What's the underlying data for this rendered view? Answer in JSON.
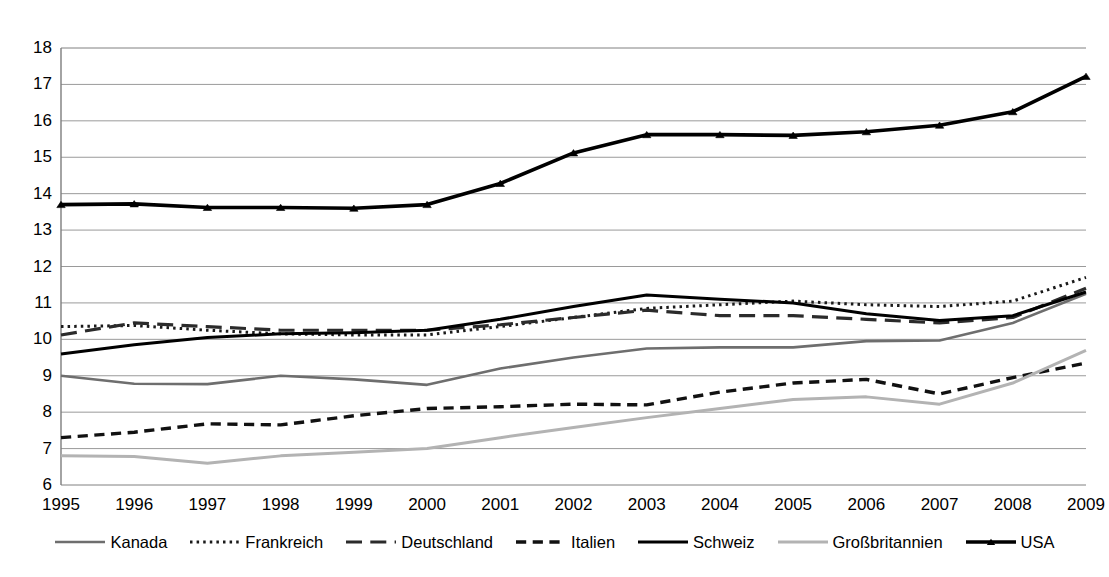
{
  "chart_data": {
    "type": "line",
    "title": "",
    "subtitle": "",
    "xlabel": "",
    "ylabel": "",
    "grid": true,
    "legend_position": "bottom",
    "xlim": [
      1995,
      2009
    ],
    "ylim": [
      6,
      18
    ],
    "ytick_step": 1,
    "categories": [
      1995,
      1996,
      1997,
      1998,
      1999,
      2000,
      2001,
      2002,
      2003,
      2004,
      2005,
      2006,
      2007,
      2008,
      2009
    ],
    "x_tick_labels": [
      "1995",
      "1996",
      "1997",
      "1998",
      "1999",
      "2000",
      "2001",
      "2002",
      "2003",
      "2004",
      "2005",
      "2006",
      "2007",
      "2008",
      "2009"
    ],
    "y_tick_labels": [
      "18",
      "17",
      "16",
      "15",
      "14",
      "13",
      "12",
      "11",
      "10",
      "9",
      "8",
      "7",
      "6"
    ],
    "series": [
      {
        "name": "Kanada",
        "color": "#6e6e6e",
        "style": "solid",
        "width": 2.6,
        "marker": "none",
        "values": [
          9.0,
          8.78,
          8.77,
          9.0,
          8.9,
          8.75,
          9.2,
          9.5,
          9.75,
          9.78,
          9.78,
          9.95,
          9.97,
          10.45,
          11.25
        ]
      },
      {
        "name": "Frankreich",
        "color": "#1a1a1a",
        "style": "dotted",
        "width": 3.0,
        "marker": "none",
        "values": [
          10.35,
          10.38,
          10.25,
          10.15,
          10.12,
          10.12,
          10.35,
          10.6,
          10.85,
          10.95,
          11.05,
          10.95,
          10.9,
          11.05,
          11.7
        ]
      },
      {
        "name": "Deutschland",
        "color": "#2b2b2b",
        "style": "longdash",
        "width": 3.2,
        "marker": "none",
        "values": [
          10.12,
          10.45,
          10.35,
          10.25,
          10.25,
          10.25,
          10.4,
          10.6,
          10.8,
          10.65,
          10.65,
          10.55,
          10.45,
          10.6,
          11.4
        ]
      },
      {
        "name": "Italien",
        "color": "#111111",
        "style": "dash",
        "width": 3.4,
        "marker": "none",
        "values": [
          7.3,
          7.45,
          7.68,
          7.65,
          7.9,
          8.1,
          8.15,
          8.22,
          8.2,
          8.55,
          8.8,
          8.9,
          8.5,
          8.95,
          9.35
        ]
      },
      {
        "name": "Schweiz",
        "color": "#000000",
        "style": "solid",
        "width": 3.0,
        "marker": "none",
        "values": [
          9.6,
          9.85,
          10.05,
          10.15,
          10.18,
          10.25,
          10.55,
          10.9,
          11.22,
          11.1,
          11.0,
          10.7,
          10.52,
          10.65,
          11.3
        ]
      },
      {
        "name": "Großbritannien",
        "color": "#b3b3b3",
        "style": "solid",
        "width": 3.0,
        "marker": "none",
        "values": [
          6.8,
          6.78,
          6.6,
          6.8,
          6.9,
          7.0,
          7.3,
          7.58,
          7.85,
          8.1,
          8.35,
          8.42,
          8.22,
          8.8,
          9.7
        ]
      },
      {
        "name": "USA",
        "color": "#000000",
        "style": "solid",
        "width": 3.6,
        "marker": "triangle",
        "values": [
          13.7,
          13.72,
          13.62,
          13.62,
          13.6,
          13.7,
          14.28,
          15.12,
          15.62,
          15.62,
          15.6,
          15.7,
          15.88,
          16.25,
          17.22
        ]
      }
    ]
  },
  "legend": {
    "items": [
      {
        "label": "Kanada"
      },
      {
        "label": "Frankreich"
      },
      {
        "label": "Deutschland"
      },
      {
        "label": "Italien"
      },
      {
        "label": "Schweiz"
      },
      {
        "label": "Großbritannien"
      },
      {
        "label": "USA"
      }
    ]
  }
}
